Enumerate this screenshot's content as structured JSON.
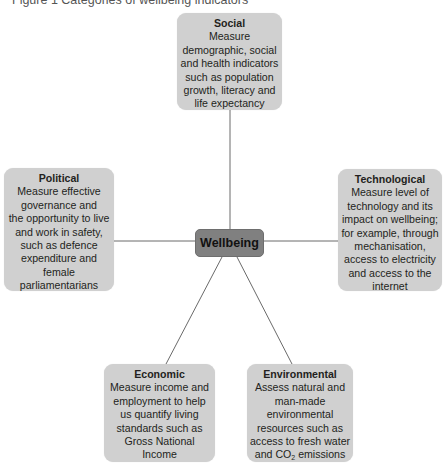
{
  "title": "Figure 1 Categories of wellbeing indicators",
  "center": {
    "label": "Wellbeing"
  },
  "nodes": {
    "social": {
      "heading": "Social",
      "body": "Measure\ndemographic, social\nand health indicators\nsuch as population\ngrowth, literacy and\nlife expectancy"
    },
    "political": {
      "heading": "Political",
      "body": "Measure effective\ngovernance and\nthe opportunity to live\nand work in safety,\nsuch as defence\nexpenditure and\nfemale\nparliamentarians"
    },
    "technological": {
      "heading": "Technological",
      "body": "Measure level of\ntechnology and its\nimpact on wellbeing;\nfor example, through\nmechanisation,\naccess to electricity\nand access to the\ninternet"
    },
    "economic": {
      "heading": "Economic",
      "body": "Measure income and\nemployment to help\nus quantify living\nstandards such as\nGross National\nIncome"
    },
    "environmental": {
      "heading": "Environmental",
      "body_pre": "Assess natural and\nman-made\nenvironmental\nresources such as\naccess to fresh water\nand CO",
      "body_sub": "2",
      "body_post": " emissions"
    }
  },
  "colors": {
    "node_fill": "#d0d0d0",
    "center_fill": "#808080",
    "connector": "#6a6a6a"
  }
}
